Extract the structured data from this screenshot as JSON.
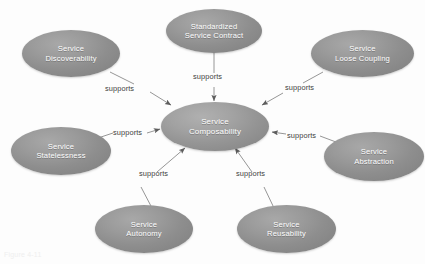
{
  "diagram": {
    "background_color": "#fdfdfd",
    "node_fill_color": "#949494",
    "node_text_color": "#ffffff",
    "edge_color": "#808080",
    "edge_label_color": "#3e3e3e",
    "center": {
      "id": "service-composability",
      "label": "Service\nComposability"
    },
    "nodes": [
      {
        "id": "standardized-service-contract",
        "label": "Standardized\nService Contract"
      },
      {
        "id": "service-discoverability",
        "label": "Service\nDiscoverability"
      },
      {
        "id": "service-loose-coupling",
        "label": "Service\nLoose Coupling"
      },
      {
        "id": "service-statelessness",
        "label": "Service\nStatelessness"
      },
      {
        "id": "service-abstraction",
        "label": "Service\nAbstraction"
      },
      {
        "id": "service-autonomy",
        "label": "Service\nAutonomy"
      },
      {
        "id": "service-reusability",
        "label": "Service\nReusability"
      }
    ],
    "edges": [
      {
        "from": "standardized-service-contract",
        "to": "service-composability",
        "label": "supports"
      },
      {
        "from": "service-discoverability",
        "to": "service-composability",
        "label": "supports"
      },
      {
        "from": "service-loose-coupling",
        "to": "service-composability",
        "label": "supports"
      },
      {
        "from": "service-statelessness",
        "to": "service-composability",
        "label": "supports"
      },
      {
        "from": "service-abstraction",
        "to": "service-composability",
        "label": "supports"
      },
      {
        "from": "service-autonomy",
        "to": "service-composability",
        "label": "supports"
      },
      {
        "from": "service-reusability",
        "to": "service-composability",
        "label": "supports"
      }
    ],
    "caption": "Figure 4-11"
  }
}
